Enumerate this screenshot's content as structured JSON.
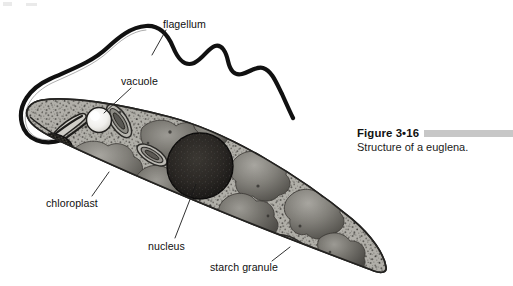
{
  "figure": {
    "title": "Figure 3•16",
    "caption": "Structure of a euglena.",
    "accent_bar_color": "#c7c7c7"
  },
  "diagram": {
    "subject": "euglena",
    "style": "grayscale textbook illustration",
    "colors": {
      "background": "#ffffff",
      "cytoplasm": "#a9a7a2",
      "cytoplasm_light": "#c3c1bb",
      "membrane_outline": "#2b2b2b",
      "chloroplast": "#6f6d68",
      "chloroplast_dark": "#4d4b47",
      "nucleus": "#252320",
      "vacuole": "#f2f1ee",
      "eyespot": "#1c1b19",
      "flagellum": "#111111",
      "granule_ring": "#3a3835",
      "leader_line": "#1a1a1a"
    }
  },
  "labels": [
    {
      "id": "flagellum",
      "text": "flagellum"
    },
    {
      "id": "vacuole",
      "text": "vacuole"
    },
    {
      "id": "chloroplast",
      "text": "chloroplast"
    },
    {
      "id": "nucleus",
      "text": "nucleus"
    },
    {
      "id": "starch_granule",
      "text": "starch granule"
    }
  ],
  "structures": [
    {
      "name": "flagellum",
      "description": "long wavy whip-like tail emerging from the anterior end, curving up and to the right"
    },
    {
      "name": "pellicle",
      "description": "outer membrane outlining the elongated spindle-shaped cell body"
    },
    {
      "name": "vacuole",
      "description": "bright round contractile vacuole near the anterior end"
    },
    {
      "name": "eyespot",
      "description": "dark stippled oval stigma below the reservoir"
    },
    {
      "name": "reservoir",
      "description": "funnel-shaped gullet at the anterior where the flagellum attaches"
    },
    {
      "name": "nucleus",
      "description": "large dark granular sphere near the center of the cell"
    },
    {
      "name": "chloroplasts",
      "description": "multiple lobed gray plastids distributed through the cytoplasm"
    },
    {
      "name": "starch granules",
      "description": "elongated concentric-ringed paramylon bodies"
    }
  ]
}
